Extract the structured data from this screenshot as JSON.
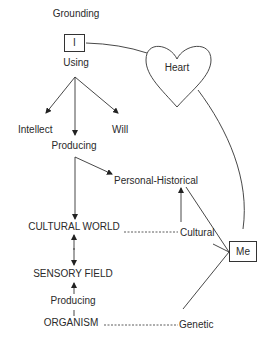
{
  "nodes": {
    "grounding": "Grounding",
    "i_box": "I",
    "using": "Using",
    "intellect": "Intellect",
    "will": "Will",
    "producing_top": "Producing",
    "personal_historical": "Personal-Historical",
    "cultural_world": "CULTURAL WORLD",
    "cultural": "Cultural",
    "sensory_field": "SENSORY FIELD",
    "producing_bottom": "Producing",
    "organism": "ORGANISM",
    "genetic": "Genetic",
    "heart": "Heart",
    "me_box": "Me"
  },
  "edges": [
    {
      "from": "I",
      "to": "Heart",
      "style": "solid-curve"
    },
    {
      "from": "Heart",
      "to": "Me",
      "style": "solid-curve"
    },
    {
      "from": "Using",
      "to": "Intellect",
      "style": "arrow"
    },
    {
      "from": "Using",
      "to": "Will",
      "style": "arrow"
    },
    {
      "from": "Using",
      "to": "Producing",
      "style": "arrow"
    },
    {
      "from": "Producing",
      "to": "Personal-Historical",
      "style": "arrow"
    },
    {
      "from": "Producing",
      "to": "CULTURAL WORLD",
      "style": "arrow"
    },
    {
      "from": "CULTURAL WORLD",
      "to": "SENSORY FIELD",
      "style": "double-arrow"
    },
    {
      "from": "Producing",
      "to": "SENSORY FIELD",
      "style": "arrow"
    },
    {
      "from": "CULTURAL WORLD",
      "to": "Cultural",
      "style": "dashed"
    },
    {
      "from": "ORGANISM",
      "to": "Genetic",
      "style": "dashed"
    },
    {
      "from": "Cultural",
      "to": "Personal-Historical",
      "style": "arrow"
    },
    {
      "from": "Personal-Historical",
      "to": "Me",
      "style": "solid"
    },
    {
      "from": "Cultural",
      "to": "Me",
      "style": "solid"
    },
    {
      "from": "Genetic",
      "to": "Me",
      "style": "solid"
    }
  ]
}
